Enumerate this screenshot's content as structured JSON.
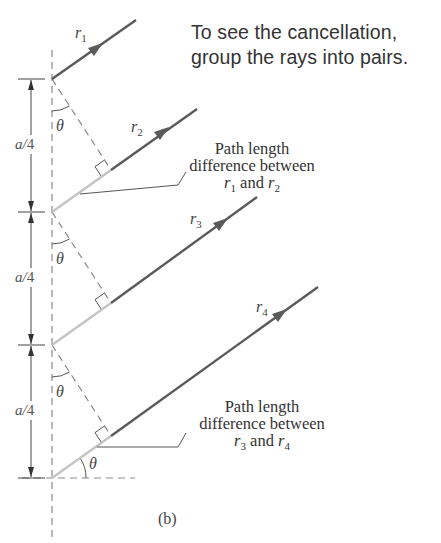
{
  "caption": {
    "line1": "To see the cancellation,",
    "line2": "group the rays into pairs."
  },
  "rays": [
    {
      "label": "r",
      "sub": "1"
    },
    {
      "label": "r",
      "sub": "2"
    },
    {
      "label": "r",
      "sub": "3"
    },
    {
      "label": "r",
      "sub": "4"
    }
  ],
  "spacing_labels": [
    {
      "a": "a",
      "slash": "/",
      "n": "4"
    },
    {
      "a": "a",
      "slash": "/",
      "n": "4"
    },
    {
      "a": "a",
      "slash": "/",
      "n": "4"
    }
  ],
  "angle_label": "θ",
  "notes": [
    {
      "line1": "Path length",
      "line2": "difference between",
      "r_a": "r",
      "sub_a": "1",
      "and": " and ",
      "r_b": "r",
      "sub_b": "2"
    },
    {
      "line1": "Path length",
      "line2": "difference between",
      "r_a": "r",
      "sub_a": "3",
      "and": " and ",
      "r_b": "r",
      "sub_b": "4"
    }
  ],
  "panel_label": "(b)",
  "colors": {
    "ray_dark": "#5a5a5a",
    "ray_light": "#bdbdbd",
    "dashed": "#8a8a8a",
    "text": "#333333"
  }
}
